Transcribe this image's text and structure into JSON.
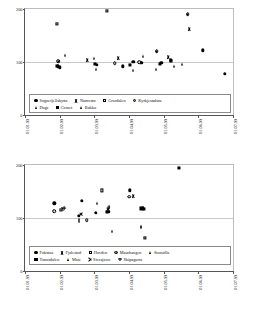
{
  "figure": {
    "axis_label_y": "Deviation (% of pillow observation)",
    "y_ticks": [
      "0",
      "100",
      "200"
    ],
    "x_ticks": [
      "01.01.99",
      "01.02.99",
      "01.03.99",
      "01.04.99",
      "01.05.99",
      "01.06.99",
      "01.07.99"
    ],
    "reference_line_value": "100"
  },
  "chart_data": [
    {
      "type": "scatter",
      "title": "",
      "xlabel": "",
      "ylabel": "Deviation (% of pillow observation)",
      "xticklabels": [
        "01.01.99",
        "01.02.99",
        "01.03.99",
        "01.04.99",
        "01.05.99",
        "01.06.99",
        "01.07.99"
      ],
      "yticklabels": [
        "0",
        "100",
        "200"
      ],
      "ylim": [
        0,
        200
      ],
      "grid": "horizontal-at-100",
      "legend_position": "inside-bottom",
      "reference_line": 100,
      "series": [
        {
          "name": "Sognefjellshytta",
          "marker": "filled-circle",
          "points": [
            {
              "x": "01.02.99",
              "xf": 0.158,
              "y": 92
            },
            {
              "x": "01.02.99",
              "xf": 0.168,
              "y": 90
            },
            {
              "x": "01.03.99",
              "xf": 0.345,
              "y": 95
            },
            {
              "x": "01.04.99",
              "xf": 0.47,
              "y": 92
            },
            {
              "x": "01.04.99",
              "xf": 0.52,
              "y": 100
            },
            {
              "x": "01.04.99",
              "xf": 0.56,
              "y": 98
            },
            {
              "x": "01.05.99",
              "xf": 0.655,
              "y": 98
            },
            {
              "x": "01.05.99",
              "xf": 0.7,
              "y": 103
            },
            {
              "x": "01.06.99",
              "xf": 0.855,
              "y": 122
            },
            {
              "x": "01.07.99",
              "xf": 0.96,
              "y": 78
            }
          ]
        },
        {
          "name": "Namvatn",
          "marker": "x",
          "points": [
            {
              "x": "01.03.99",
              "xf": 0.3,
              "y": 104
            },
            {
              "x": "01.04.99",
              "xf": 0.448,
              "y": 108
            },
            {
              "x": "01.05.99",
              "xf": 0.69,
              "y": 110
            },
            {
              "x": "01.06.99",
              "xf": 0.79,
              "y": 163
            }
          ]
        },
        {
          "name": "Grasdalen",
          "marker": "open-square",
          "points": [
            {
              "x": "01.02.99",
              "xf": 0.152,
              "y": 172
            },
            {
              "x": "01.03.99",
              "xf": 0.395,
              "y": 197
            }
          ]
        },
        {
          "name": "Kyrkjestølane",
          "marker": "circle-dot",
          "points": [
            {
              "x": "01.02.99",
              "xf": 0.16,
              "y": 101
            },
            {
              "x": "01.04.99",
              "xf": 0.432,
              "y": 98
            },
            {
              "x": "01.04.99",
              "xf": 0.548,
              "y": 100
            },
            {
              "x": "01.05.99",
              "xf": 0.633,
              "y": 120
            },
            {
              "x": "01.06.99",
              "xf": 0.782,
              "y": 190
            }
          ]
        },
        {
          "name": "Dugr",
          "marker": "filled-triangle",
          "points": [
            {
              "x": "01.02.99",
              "xf": 0.17,
              "y": 90
            },
            {
              "x": "01.02.99",
              "xf": 0.192,
              "y": 113
            },
            {
              "x": "01.03.99",
              "xf": 0.33,
              "y": 108
            },
            {
              "x": "01.03.99",
              "xf": 0.34,
              "y": 86
            },
            {
              "x": "01.04.99",
              "xf": 0.52,
              "y": 85
            },
            {
              "x": "01.05.99",
              "xf": 0.628,
              "y": 86
            },
            {
              "x": "01.05.99",
              "xf": 0.718,
              "y": 92
            },
            {
              "x": "01.06.99",
              "xf": 0.755,
              "y": 96
            }
          ]
        },
        {
          "name": "Groset",
          "marker": "filled-square",
          "points": [
            {
              "x": "01.02.99",
              "xf": 0.155,
              "y": 92
            },
            {
              "x": "01.03.99",
              "xf": 0.335,
              "y": 96
            },
            {
              "x": "01.04.99",
              "xf": 0.505,
              "y": 95
            },
            {
              "x": "01.05.99",
              "xf": 0.648,
              "y": 97
            },
            {
              "x": "01.05.99",
              "xf": 0.702,
              "y": 102
            }
          ]
        },
        {
          "name": "Bakko",
          "marker": "filled-triangle",
          "points": [
            {
              "x": "01.04.99",
              "xf": 0.56,
              "y": 100
            },
            {
              "x": "01.05.99",
              "xf": 0.565,
              "y": 112
            }
          ]
        }
      ]
    },
    {
      "type": "scatter",
      "title": "",
      "xlabel": "",
      "ylabel": "Deviation (% of pillow observation)",
      "xticklabels": [
        "01.01.99",
        "01.02.99",
        "01.03.99",
        "01.04.99",
        "01.05.99",
        "01.06.99",
        "01.07.99"
      ],
      "yticklabels": [
        "0",
        "100",
        "200"
      ],
      "ylim": [
        0,
        200
      ],
      "grid": "horizontal-at-100",
      "legend_position": "inside-bottom",
      "reference_line": 100,
      "series": [
        {
          "name": "Fokstua",
          "marker": "filled-circle",
          "points": [
            {
              "x": "01.02.99",
              "xf": 0.14,
              "y": 128
            },
            {
              "x": "01.03.99",
              "xf": 0.272,
              "y": 132
            },
            {
              "x": "01.03.99",
              "xf": 0.258,
              "y": 104
            },
            {
              "x": "01.03.99",
              "xf": 0.34,
              "y": 110
            },
            {
              "x": "01.04.99",
              "xf": 0.4,
              "y": 112
            },
            {
              "x": "01.04.99",
              "xf": 0.505,
              "y": 152
            },
            {
              "x": "01.04.99",
              "xf": 0.565,
              "y": 118
            }
          ]
        },
        {
          "name": "Fjalestad",
          "marker": "x",
          "points": [
            {
              "x": "01.02.99",
              "xf": 0.178,
              "y": 117
            },
            {
              "x": "01.04.99",
              "xf": 0.522,
              "y": 142
            }
          ]
        },
        {
          "name": "Hovden",
          "marker": "open-square",
          "points": [
            {
              "x": "01.02.99",
              "xf": 0.172,
              "y": 116
            },
            {
              "x": "01.03.99",
              "xf": 0.37,
              "y": 152
            },
            {
              "x": "01.04.99",
              "xf": 0.578,
              "y": 62
            }
          ]
        },
        {
          "name": "Maurhaugen",
          "marker": "circle-dot",
          "points": [
            {
              "x": "01.02.99",
              "xf": 0.14,
              "y": 113
            },
            {
              "x": "01.03.99",
              "xf": 0.297,
              "y": 96
            },
            {
              "x": "01.04.99",
              "xf": 0.5,
              "y": 140
            }
          ]
        },
        {
          "name": "Storsölla",
          "marker": "filled-triangle",
          "points": [
            {
              "x": "01.03.99",
              "xf": 0.258,
              "y": 98
            },
            {
              "x": "01.03.99",
              "xf": 0.262,
              "y": 94
            },
            {
              "x": "01.04.99",
              "xf": 0.418,
              "y": 75
            },
            {
              "x": "01.04.99",
              "xf": 0.558,
              "y": 85
            }
          ]
        },
        {
          "name": "Tunnsdalen",
          "marker": "filled-square",
          "points": [
            {
              "x": "01.03.99",
              "xf": 0.392,
              "y": 112
            },
            {
              "x": "01.04.99",
              "xf": 0.56,
              "y": 118
            },
            {
              "x": "01.04.99",
              "xf": 0.57,
              "y": 117
            },
            {
              "x": "01.05.99",
              "xf": 0.742,
              "y": 194
            }
          ]
        },
        {
          "name": "Masi",
          "marker": "filled-triangle",
          "points": [
            {
              "x": "01.03.99",
              "xf": 0.348,
              "y": 128
            },
            {
              "x": "01.04.99",
              "xf": 0.56,
              "y": 83
            }
          ]
        },
        {
          "name": "Siccajavre",
          "marker": "plus-diagonal",
          "points": [
            {
              "x": "01.03.99",
              "xf": 0.268,
              "y": 108
            },
            {
              "x": "01.04.99",
              "xf": 0.4,
              "y": 117
            }
          ]
        },
        {
          "name": "Skipagurra",
          "marker": "plus",
          "points": [
            {
              "x": "01.03.99",
              "xf": 0.188,
              "y": 118
            },
            {
              "x": "01.04.99",
              "xf": 0.402,
              "y": 120
            }
          ]
        }
      ]
    }
  ],
  "legend_top": {
    "rows": [
      [
        {
          "label": "Sognefjellshytta",
          "marker": "filled-circle"
        },
        {
          "label": "Namvatn",
          "marker": "x"
        },
        {
          "label": "Grasdalen",
          "marker": "open-square"
        },
        {
          "label": "Kyrkjestølane",
          "marker": "circle-dot"
        }
      ],
      [
        {
          "label": "Dugr",
          "marker": "filled-triangle"
        },
        {
          "label": "Groset",
          "marker": "filled-square"
        },
        {
          "label": "Bakko",
          "marker": "filled-triangle"
        }
      ]
    ]
  },
  "legend_bottom": {
    "rows": [
      [
        {
          "label": "Fokstua",
          "marker": "filled-circle"
        },
        {
          "label": "Fjalestad",
          "marker": "x"
        },
        {
          "label": "Hovden",
          "marker": "open-square"
        },
        {
          "label": "Maurhaugen",
          "marker": "circle-dot"
        },
        {
          "label": "Storsölla",
          "marker": "filled-triangle"
        }
      ],
      [
        {
          "label": "Tunnsdalen",
          "marker": "filled-square"
        },
        {
          "label": "Masi",
          "marker": "filled-triangle"
        },
        {
          "label": "Siccajavre",
          "marker": "plus-diagonal"
        },
        {
          "label": "Skipagurra",
          "marker": "plus"
        }
      ]
    ]
  }
}
